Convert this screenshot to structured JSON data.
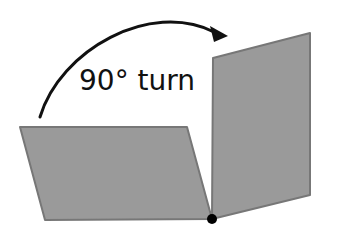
{
  "diagram": {
    "label": "90° turn",
    "colors": {
      "panel_fill": "#9a9a9a",
      "panel_stroke": "#777777",
      "arrow": "#111111",
      "pivot": "#000000",
      "text": "#111111",
      "background": "#ffffff"
    },
    "shapes": {
      "flat_panel": {
        "points": "20,127 187,127 212,219 45,220"
      },
      "upright_panel": {
        "points": "213,58 310,33 310,195 212,219"
      },
      "pivot_point": {
        "cx": 212,
        "cy": 219,
        "r": 5
      },
      "rotation_arrow": {
        "path": "M 40 117 C 60 50, 150 0, 214 32",
        "head": "228,36 210,26 214,42"
      }
    }
  }
}
